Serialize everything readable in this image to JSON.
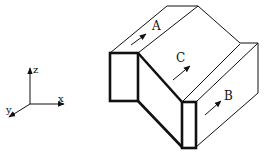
{
  "diagram": {
    "type": "isometric-block-with-flow-arrows",
    "axes": {
      "labels": {
        "x": "x",
        "y": "y",
        "z": "z"
      }
    },
    "regions": [
      {
        "id": "A",
        "label": "A"
      },
      {
        "id": "B",
        "label": "B"
      },
      {
        "id": "C",
        "label": "C"
      }
    ],
    "colors": {
      "line": "#111111",
      "background": "#ffffff"
    }
  }
}
